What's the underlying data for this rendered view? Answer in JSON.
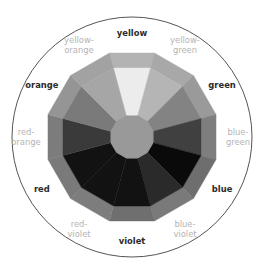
{
  "diagram": {
    "segments": [
      {
        "name": "yellow",
        "label_lines": [
          "yellow"
        ],
        "kind": "major",
        "inner_color": "#ececec",
        "outer_color": "#b3b3b3"
      },
      {
        "name": "yellow-green",
        "label_lines": [
          "yellow-",
          "green"
        ],
        "kind": "minor",
        "inner_color": "#b5b5b5",
        "outer_color": "#a8a8a8"
      },
      {
        "name": "green",
        "label_lines": [
          "green"
        ],
        "kind": "major",
        "inner_color": "#838383",
        "outer_color": "#9a9a9a"
      },
      {
        "name": "blue-green",
        "label_lines": [
          "blue-",
          "green"
        ],
        "kind": "minor",
        "inner_color": "#404040",
        "outer_color": "#7e7e7e"
      },
      {
        "name": "blue",
        "label_lines": [
          "blue"
        ],
        "kind": "major",
        "inner_color": "#0a0a0a",
        "outer_color": "#6e6e6e"
      },
      {
        "name": "blue-violet",
        "label_lines": [
          "blue-",
          "violet"
        ],
        "kind": "minor",
        "inner_color": "#2a2a2a",
        "outer_color": "#7a7a7a"
      },
      {
        "name": "violet",
        "label_lines": [
          "violet"
        ],
        "kind": "major",
        "inner_color": "#121212",
        "outer_color": "#6f6f6f"
      },
      {
        "name": "red-violet",
        "label_lines": [
          "red-",
          "violet"
        ],
        "kind": "minor",
        "inner_color": "#121212",
        "outer_color": "#7d7d7d"
      },
      {
        "name": "red",
        "label_lines": [
          "red"
        ],
        "kind": "major",
        "inner_color": "#121212",
        "outer_color": "#7a7a7a"
      },
      {
        "name": "red-orange",
        "label_lines": [
          "red-",
          "orange"
        ],
        "kind": "minor",
        "inner_color": "#3a3a3a",
        "outer_color": "#7c7c7c"
      },
      {
        "name": "orange",
        "label_lines": [
          "orange"
        ],
        "kind": "major",
        "inner_color": "#7a7a7a",
        "outer_color": "#959595"
      },
      {
        "name": "yellow-orange",
        "label_lines": [
          "yellow-",
          "orange"
        ],
        "kind": "minor",
        "inner_color": "#a6a6a6",
        "outer_color": "#a2a2a2"
      }
    ],
    "center_color": "#999999",
    "ring_color": "#555555"
  }
}
